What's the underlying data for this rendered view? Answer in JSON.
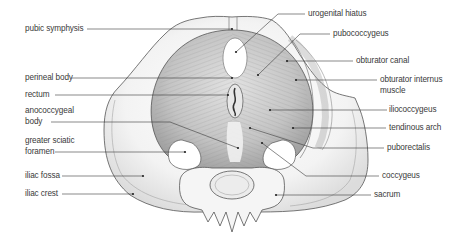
{
  "diagram": {
    "labels_left": [
      {
        "id": "pubic-symphysis",
        "text": "pubic symphysis"
      },
      {
        "id": "perineal-body",
        "text": "perineal body"
      },
      {
        "id": "rectum",
        "text": "rectum"
      },
      {
        "id": "anococcygeal-body",
        "line1": "anococcygeal",
        "line2": "body"
      },
      {
        "id": "greater-sciatic-foramen",
        "line1": "greater sciatic",
        "line2": "foramen"
      },
      {
        "id": "iliac-fossa",
        "text": "iliac fossa"
      },
      {
        "id": "iliac-crest",
        "text": "iliac crest"
      }
    ],
    "labels_right": [
      {
        "id": "urogenital-hiatus",
        "text": "urogenital hiatus"
      },
      {
        "id": "pubococcygeus",
        "text": "pubococcygeus"
      },
      {
        "id": "obturator-canal",
        "text": "obturator canal"
      },
      {
        "id": "obturator-internus-muscle",
        "line1": "obturator internus",
        "line2": "muscle"
      },
      {
        "id": "iliococcygeus",
        "text": "iliococcygeus"
      },
      {
        "id": "tendinous-arch",
        "text": "tendinous arch"
      },
      {
        "id": "puborectalis",
        "text": "puborectalis"
      },
      {
        "id": "coccygeus",
        "text": "coccygeus"
      },
      {
        "id": "sacrum",
        "text": "sacrum"
      }
    ],
    "signature": "",
    "colors": {
      "line": "#3a3a3a",
      "bone_fill": "#f4f4f4",
      "bone_edge": "#555555",
      "muscle_fill": "#c9c9c9",
      "muscle_stroke": "#8a8a8a",
      "opening_fill": "#ffffff"
    }
  }
}
